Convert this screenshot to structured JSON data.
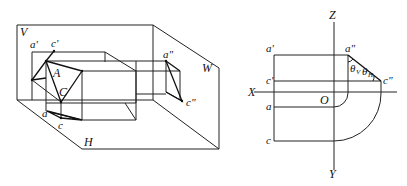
{
  "figure_left": {
    "title": "Pictorial view of projection planes",
    "planes": {
      "V": "V",
      "H": "H",
      "W": "W"
    },
    "points": {
      "A": "A",
      "C": "C",
      "a1": "a'",
      "c1": "c'",
      "a": "a",
      "c": "c",
      "a2": "a\"",
      "c2": "c\""
    }
  },
  "figure_right": {
    "title": "Three-view projection",
    "axes": {
      "Z": "Z",
      "X": "X",
      "Y": "Y",
      "O": "O"
    },
    "points": {
      "a1": "a'",
      "c1": "c'",
      "a": "a",
      "c": "c",
      "a2": "a\"",
      "c2": "c\""
    },
    "angles": {
      "theta_v": "θ",
      "theta_v_sub": "V",
      "theta_h": "θ",
      "theta_h_sub": "H"
    }
  }
}
